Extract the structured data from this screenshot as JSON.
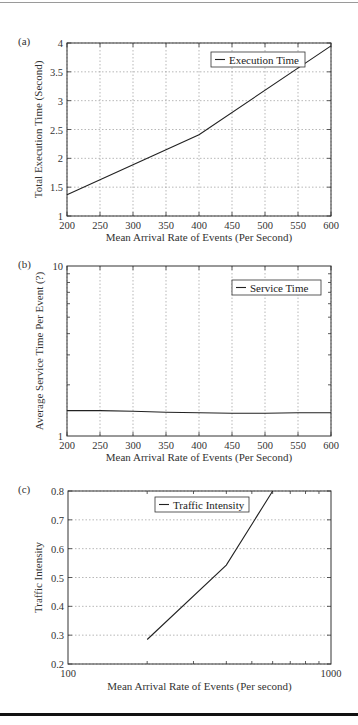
{
  "chart_data": [
    {
      "id": "a",
      "panel_label": "(a)",
      "type": "line",
      "title": "",
      "xlabel": "Mean Arrival Rate of Events (Per Second)",
      "ylabel": "Total Execution Time (Second)",
      "xscale": "linear",
      "yscale": "linear",
      "xlim": [
        200,
        600
      ],
      "ylim": [
        1,
        4
      ],
      "xticks": [
        200,
        250,
        300,
        350,
        400,
        450,
        500,
        550,
        600
      ],
      "yticks": [
        1,
        1.5,
        2,
        2.5,
        3,
        3.5,
        4
      ],
      "grid": true,
      "legend_position": "upper right",
      "series": [
        {
          "name": "Execution Time",
          "x": [
            200,
            400,
            600
          ],
          "values": [
            1.37,
            2.41,
            3.95
          ]
        }
      ]
    },
    {
      "id": "b",
      "panel_label": "(b)",
      "type": "line",
      "title": "",
      "xlabel": "Mean Arrival Rate of Events (Per Second)",
      "ylabel": "Average Service Time Per Event (?)",
      "xscale": "linear",
      "yscale": "log",
      "xlim": [
        200,
        600
      ],
      "ylim": [
        1,
        10
      ],
      "xticks": [
        200,
        250,
        300,
        350,
        400,
        450,
        500,
        550,
        600
      ],
      "yticks": [
        1,
        10
      ],
      "grid": true,
      "legend_position": "upper right",
      "series": [
        {
          "name": "Service Time",
          "x": [
            200,
            250,
            300,
            350,
            400,
            450,
            500,
            550,
            600
          ],
          "values": [
            1.41,
            1.41,
            1.4,
            1.38,
            1.37,
            1.36,
            1.36,
            1.37,
            1.37
          ]
        }
      ]
    },
    {
      "id": "c",
      "panel_label": "(c)",
      "type": "line",
      "title": "",
      "xlabel": "Mean Arrival Rate of Events (Per second)",
      "ylabel": "Traffic Intensity",
      "xscale": "log",
      "yscale": "linear",
      "xlim": [
        100,
        1000
      ],
      "ylim": [
        0.2,
        0.8
      ],
      "xticks": [
        100,
        1000
      ],
      "yticks": [
        0.2,
        0.3,
        0.4,
        0.5,
        0.6,
        0.7,
        0.8
      ],
      "grid": true,
      "legend_position": "upper center",
      "series": [
        {
          "name": "Traffic Intensity",
          "x": [
            200,
            400,
            600
          ],
          "values": [
            0.285,
            0.543,
            0.8
          ]
        }
      ]
    }
  ]
}
